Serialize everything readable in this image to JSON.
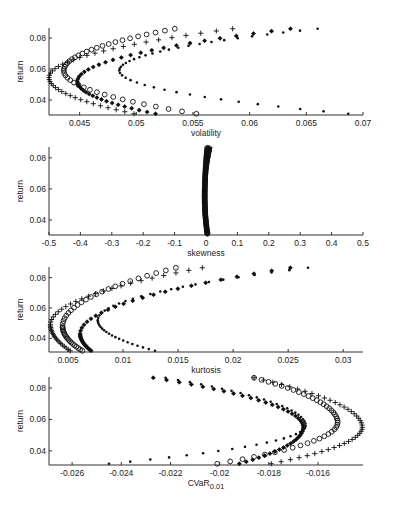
{
  "figure": {
    "background": "#ffffff",
    "marker_color": "#111111"
  },
  "chart_data": [
    {
      "type": "scatter",
      "title": "",
      "xlabel": "volatility",
      "ylabel": "return",
      "xlim": [
        0.0423,
        0.07
      ],
      "ylim": [
        0.0303,
        0.0865
      ],
      "xticks": [
        0.045,
        0.05,
        0.055,
        0.06,
        0.065,
        0.07
      ],
      "xtick_labels": [
        "0.045",
        "0.05",
        "0.055",
        "0.06",
        "0.065",
        "0.07"
      ],
      "yticks": [
        0.04,
        0.06,
        0.08
      ],
      "ytick_labels": [
        "0.04",
        "0.06",
        "0.08"
      ],
      "grid": false,
      "legend": "none",
      "series": [
        {
          "name": "plus",
          "marker": "+",
          "x_min": 0.0423,
          "y_at_min": 0.0545,
          "x_top": 0.0585,
          "x_bottom": 0.0498
        },
        {
          "name": "circle",
          "marker": "o",
          "x_min": 0.0436,
          "y_at_min": 0.059,
          "x_top": 0.0534,
          "x_bottom": 0.0553
        },
        {
          "name": "star",
          "marker": "*",
          "x_min": 0.0448,
          "y_at_min": 0.052,
          "x_top": 0.0636,
          "x_bottom": 0.0517
        },
        {
          "name": "dot",
          "marker": ".",
          "x_min": 0.0485,
          "y_at_min": 0.059,
          "x_top": 0.066,
          "x_bottom": 0.0687
        }
      ],
      "frame": {
        "x0": 49,
        "x1": 363,
        "y0": 28,
        "y1": 115
      }
    },
    {
      "type": "scatter",
      "title": "",
      "xlabel": "skewness",
      "ylabel": "return",
      "xlim": [
        -0.5,
        0.5
      ],
      "ylim": [
        0.0303,
        0.087
      ],
      "xticks": [
        -0.5,
        -0.4,
        -0.3,
        -0.2,
        -0.1,
        0,
        0.1,
        0.2,
        0.3,
        0.4,
        0.5
      ],
      "xtick_labels": [
        "-0.5",
        "-0.4",
        "-0.3",
        "-0.2",
        "-0.1",
        "0",
        "0.1",
        "0.2",
        "0.3",
        "0.4",
        "0.5"
      ],
      "yticks": [
        0.04,
        0.06,
        0.08
      ],
      "ytick_labels": [
        "0.04",
        "0.06",
        "0.08"
      ],
      "grid": false,
      "legend": "none",
      "series": [
        {
          "name": "plus",
          "marker": "+",
          "x_min": -0.005,
          "y_at_min": 0.055,
          "x_top": 0.012,
          "x_bottom": 0.006
        },
        {
          "name": "circle",
          "marker": "o",
          "x_min": -0.004,
          "y_at_min": 0.055,
          "x_top": 0.004,
          "x_bottom": 0.004
        },
        {
          "name": "star",
          "marker": "*",
          "x_min": -0.003,
          "y_at_min": 0.055,
          "x_top": 0.006,
          "x_bottom": 0.003
        },
        {
          "name": "dot",
          "marker": ".",
          "x_min": -0.002,
          "y_at_min": 0.055,
          "x_top": 0.016,
          "x_bottom": 0.008
        }
      ],
      "frame": {
        "x0": 49,
        "x1": 363,
        "y0": 147,
        "y1": 235
      }
    },
    {
      "type": "scatter",
      "title": "",
      "xlabel": "kurtosis",
      "ylabel": "return",
      "xlim": [
        0.00327,
        0.0318
      ],
      "ylim": [
        0.031,
        0.087
      ],
      "xticks": [
        0.005,
        0.01,
        0.015,
        0.02,
        0.025,
        0.03
      ],
      "xtick_labels": [
        "0.005",
        "0.01",
        "0.015",
        "0.02",
        "0.025",
        "0.03"
      ],
      "yticks": [
        0.04,
        0.06,
        0.08
      ],
      "ytick_labels": [
        "0.04",
        "0.06",
        "0.08"
      ],
      "grid": false,
      "legend": "none",
      "series": [
        {
          "name": "plus",
          "marker": "+",
          "x_min": 0.0034,
          "y_at_min": 0.049,
          "x_top": 0.0172,
          "x_bottom": 0.0052
        },
        {
          "name": "circle",
          "marker": "o",
          "x_min": 0.0045,
          "y_at_min": 0.048,
          "x_top": 0.0148,
          "x_bottom": 0.0063
        },
        {
          "name": "star",
          "marker": "*",
          "x_min": 0.0061,
          "y_at_min": 0.043,
          "x_top": 0.0252,
          "x_bottom": 0.0071
        },
        {
          "name": "dot",
          "marker": ".",
          "x_min": 0.0077,
          "y_at_min": 0.052,
          "x_top": 0.0268,
          "x_bottom": 0.0129
        }
      ],
      "frame": {
        "x0": 49,
        "x1": 363,
        "y0": 267,
        "y1": 352
      }
    },
    {
      "type": "scatter",
      "title": "",
      "xlabel": "CVaR",
      "xlabel_subscript": "0.01",
      "ylabel": "return",
      "xlim": [
        -0.02694,
        -0.01417
      ],
      "ylim": [
        0.031,
        0.087
      ],
      "xticks": [
        -0.026,
        -0.024,
        -0.022,
        -0.02,
        -0.018,
        -0.016
      ],
      "xtick_labels": [
        "-0.026",
        "-0.024",
        "-0.022",
        "-0.02",
        "-0.018",
        "-0.016"
      ],
      "yticks": [
        0.04,
        0.06,
        0.08
      ],
      "ytick_labels": [
        "0.04",
        "0.06",
        "0.08"
      ],
      "grid": false,
      "legend": "none",
      "series": [
        {
          "name": "plus",
          "marker": "+",
          "x_max": -0.0142,
          "y_at_max": 0.055,
          "x_top": -0.0186,
          "x_bottom": -0.0179
        },
        {
          "name": "circle",
          "marker": "o",
          "x_max": -0.0152,
          "y_at_max": 0.058,
          "x_top": -0.0186,
          "x_bottom": -0.0201
        },
        {
          "name": "star",
          "marker": "*",
          "x_max": -0.0166,
          "y_at_max": 0.055,
          "x_top": -0.0227,
          "x_bottom": -0.0192
        },
        {
          "name": "dot",
          "marker": ".",
          "x_max": -0.0165,
          "y_at_max": 0.056,
          "x_top": -0.0222,
          "x_bottom": -0.0245
        }
      ],
      "frame": {
        "x0": 49,
        "x1": 363,
        "y0": 377,
        "y1": 465
      }
    }
  ],
  "labels": {
    "panel1_ylabel": "return",
    "panel1_xlabel": "volatility",
    "panel2_ylabel": "return",
    "panel2_xlabel": "skewness",
    "panel3_ylabel": "return",
    "panel3_xlabel": "kurtosis",
    "panel4_ylabel": "return",
    "panel4_xlabel": "CVaR",
    "panel4_xlabel_sub": "0.01"
  }
}
